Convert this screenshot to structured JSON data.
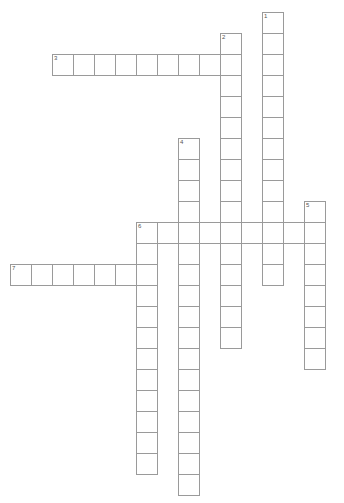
{
  "puzzle": {
    "type": "crossword-grid",
    "title": "Crossword Puzzle Grid",
    "cell_size": 21,
    "origin_x": 10,
    "origin_y": 12,
    "grid_cols": 16,
    "grid_rows": 24,
    "colors": {
      "cell_border": "#9a9a9a",
      "cell_fill": "#ffffff",
      "number_text": "#555555",
      "background": "#ffffff"
    },
    "entries": [
      {
        "number": "1",
        "direction": "down",
        "col": 12,
        "row": 0,
        "length": 13
      },
      {
        "number": "2",
        "direction": "down",
        "col": 10,
        "row": 1,
        "length": 15
      },
      {
        "number": "3",
        "direction": "across",
        "col": 2,
        "row": 2,
        "length": 9
      },
      {
        "number": "4",
        "direction": "down",
        "col": 8,
        "row": 6,
        "length": 17
      },
      {
        "number": "5",
        "direction": "down",
        "col": 14,
        "row": 9,
        "length": 8
      },
      {
        "number": "6",
        "direction": "across",
        "col": 6,
        "row": 10,
        "length": 9
      },
      {
        "number": "6",
        "direction": "down",
        "col": 6,
        "row": 10,
        "length": 12
      },
      {
        "number": "7",
        "direction": "across",
        "col": 0,
        "row": 12,
        "length": 7
      }
    ],
    "numbered_cells": [
      {
        "label": "1",
        "col": 12,
        "row": 0
      },
      {
        "label": "2",
        "col": 10,
        "row": 1
      },
      {
        "label": "3",
        "col": 2,
        "row": 2
      },
      {
        "label": "4",
        "col": 8,
        "row": 6
      },
      {
        "label": "5",
        "col": 14,
        "row": 9
      },
      {
        "label": "6",
        "col": 6,
        "row": 10
      },
      {
        "label": "7",
        "col": 0,
        "row": 12
      }
    ]
  }
}
